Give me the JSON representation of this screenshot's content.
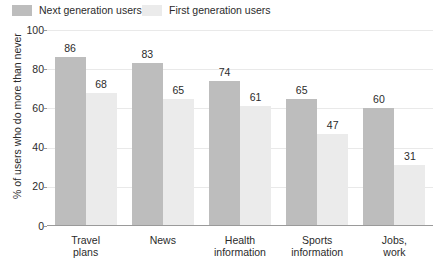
{
  "chart_data": {
    "type": "bar",
    "title": "",
    "xlabel": "",
    "ylabel": "% of users who do more than never",
    "ylim": [
      0,
      100
    ],
    "yticks": [
      0,
      20,
      40,
      60,
      80,
      100
    ],
    "ytick_labels": [
      "0",
      "20",
      "40",
      "60",
      "80",
      "100"
    ],
    "grid": true,
    "legend_position": "top-left",
    "categories": [
      "Travel\nplans",
      "News",
      "Health\ninformation",
      "Sports\ninformation",
      "Jobs,\nwork"
    ],
    "series": [
      {
        "name": "Next generation users",
        "color": "#bdbdbd",
        "values": [
          86,
          83,
          74,
          65,
          60
        ],
        "value_labels": [
          "86",
          "83",
          "74",
          "65",
          "60"
        ]
      },
      {
        "name": "First generation users",
        "color": "#ebebeb",
        "values": [
          68,
          65,
          61,
          47,
          31
        ],
        "value_labels": [
          "68",
          "65",
          "61",
          "47",
          "31"
        ]
      }
    ]
  },
  "colors": {
    "background": "#ffffff",
    "text": "#2b2b2b",
    "gridline": "#e9e9e9",
    "axis": "#9a9a9a",
    "series_next_generation": "#bdbdbd",
    "series_first_generation": "#ebebeb"
  }
}
